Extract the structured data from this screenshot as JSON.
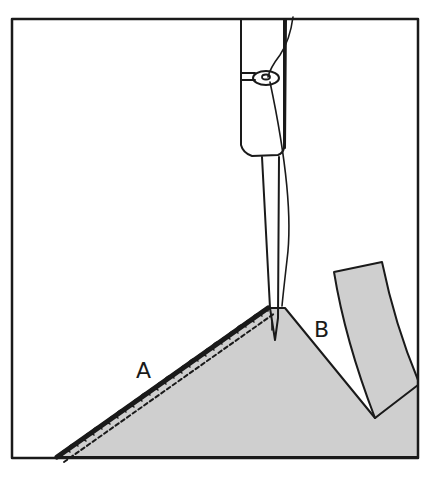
{
  "figure": {
    "labels": {
      "a": "A",
      "b": "B"
    },
    "colors": {
      "ink": "#1a1a1a",
      "fabric": "#cfcfcf",
      "background": "#ffffff"
    },
    "elements": [
      "frame",
      "needle-clamp",
      "thread-guide",
      "needle",
      "thread",
      "fabric-panel",
      "overcast-stitched-edge",
      "cut-strip"
    ]
  }
}
